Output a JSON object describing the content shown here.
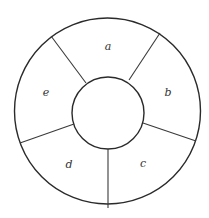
{
  "diagram": {
    "type": "annulus-sectors",
    "outer_circle": {
      "cx": 107.5,
      "cy": 111,
      "r": 93
    },
    "inner_circle": {
      "cx": 108,
      "cy": 113,
      "r": 36
    },
    "stroke_color": "#2a2a2a",
    "sectors": [
      {
        "label": "a",
        "label_pos": {
          "x": 108,
          "y": 47
        }
      },
      {
        "label": "b",
        "label_pos": {
          "x": 168,
          "y": 93
        }
      },
      {
        "label": "c",
        "label_pos": {
          "x": 143,
          "y": 164
        }
      },
      {
        "label": "d",
        "label_pos": {
          "x": 69,
          "y": 165
        }
      },
      {
        "label": "e",
        "label_pos": {
          "x": 46,
          "y": 93
        }
      }
    ],
    "dividers": [
      {
        "between": "a-b",
        "x1": 129,
        "y1": 80,
        "x2": 160,
        "y2": 33
      },
      {
        "between": "b-c",
        "x1": 143,
        "y1": 123,
        "x2": 196,
        "y2": 141
      },
      {
        "between": "c-d",
        "x1": 108,
        "y1": 149,
        "x2": 108,
        "y2": 208
      },
      {
        "between": "d-e",
        "x1": 74,
        "y1": 124,
        "x2": 20,
        "y2": 143
      },
      {
        "between": "e-a",
        "x1": 86,
        "y1": 83,
        "x2": 51,
        "y2": 36
      }
    ]
  }
}
